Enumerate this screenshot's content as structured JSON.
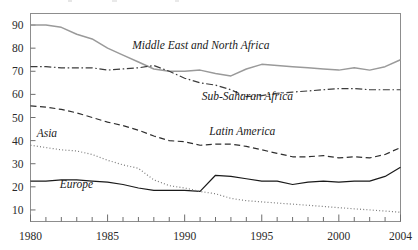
{
  "chart_data": {
    "type": "line",
    "title": "",
    "xlabel": "",
    "ylabel": "",
    "xlim": [
      1980,
      2004
    ],
    "ylim": [
      5,
      95
    ],
    "grid": false,
    "legend_position": "inline-annotations",
    "y_ticks": [
      10,
      20,
      30,
      40,
      50,
      60,
      70,
      80,
      90
    ],
    "y_tick_labels": [
      "10",
      "20",
      "30",
      "40",
      "50",
      "60",
      "70",
      "80",
      "90"
    ],
    "x": [
      1980,
      1981,
      1982,
      1983,
      1984,
      1985,
      1986,
      1987,
      1988,
      1989,
      1990,
      1991,
      1992,
      1993,
      1994,
      1995,
      1996,
      1997,
      1998,
      1999,
      2000,
      2001,
      2002,
      2003,
      2004
    ],
    "x_ticks": [
      1980,
      1981,
      1982,
      1983,
      1984,
      1985,
      1986,
      1987,
      1988,
      1989,
      1990,
      1991,
      1992,
      1993,
      1994,
      1995,
      1996,
      1997,
      1998,
      1999,
      2000,
      2001,
      2002,
      2003,
      2004
    ],
    "x_tick_labels": [
      {
        "value": 1980,
        "label": "1980"
      },
      {
        "value": 1985,
        "label": "1985"
      },
      {
        "value": 1990,
        "label": "1990"
      },
      {
        "value": 1995,
        "label": "1995"
      },
      {
        "value": 2000,
        "label": "2000"
      },
      {
        "value": 2004,
        "label": "2004"
      }
    ],
    "series": [
      {
        "name": "Middle East and North Africa",
        "style": "solid",
        "color": "#9a9a9a",
        "width": 1.5,
        "label_text": "Middle East and North Africa",
        "label_x": 1986.6,
        "label_y": 79.5,
        "values": [
          90,
          90,
          89,
          86,
          84,
          80,
          77,
          74,
          71,
          70,
          70,
          70.5,
          69,
          68,
          71,
          73,
          72.5,
          72,
          71.5,
          71,
          70.5,
          71.5,
          70.5,
          72,
          75
        ]
      },
      {
        "name": "Sub-Saharan Africa",
        "style": "dashdot",
        "color": "#3c3c3c",
        "width": 1.2,
        "label_text": "Sub-Saharan Africa",
        "label_x": 1991.1,
        "label_y": 57.5,
        "values": [
          72,
          72,
          71.5,
          71.5,
          71.5,
          70.5,
          71,
          71.5,
          72.5,
          70,
          67,
          65,
          64,
          62,
          59,
          59.5,
          60.5,
          61,
          61.5,
          62,
          62.5,
          62.5,
          62,
          62,
          62
        ]
      },
      {
        "name": "Latin America",
        "style": "dashed",
        "color": "#2e2e2e",
        "width": 1.2,
        "label_text": "Latin America",
        "label_x": 1991.6,
        "label_y": 42.5,
        "values": [
          55,
          54.5,
          53.5,
          52,
          50,
          48,
          46.5,
          44.5,
          42,
          40,
          39.5,
          38,
          38.5,
          38.5,
          37.5,
          36,
          34.5,
          33,
          33,
          33.5,
          32.5,
          33,
          32.5,
          34,
          37
        ]
      },
      {
        "name": "Europe",
        "style": "solid",
        "color": "#1a1a1a",
        "width": 1.2,
        "label_text": "Europe",
        "label_x": 1981.9,
        "label_y": 19.3,
        "values": [
          22.5,
          22.5,
          23,
          23,
          22.5,
          22,
          21,
          19.5,
          18.5,
          18.5,
          18.5,
          18,
          25,
          24.5,
          23.5,
          22.5,
          22.5,
          21,
          22,
          22.5,
          22,
          22.5,
          22.5,
          24.5,
          28.5
        ]
      },
      {
        "name": "Asia",
        "style": "dotted",
        "color": "#7a7a7a",
        "width": 1.2,
        "label_text": "Asia",
        "label_x": 1980.4,
        "label_y": 41.5,
        "values": [
          38,
          37,
          36,
          35.5,
          34,
          31.5,
          29.5,
          28,
          23,
          20.5,
          19.5,
          18,
          17,
          15,
          14,
          13.5,
          13,
          12.5,
          12,
          11.5,
          11,
          10.5,
          10,
          9.5,
          9
        ]
      }
    ]
  }
}
